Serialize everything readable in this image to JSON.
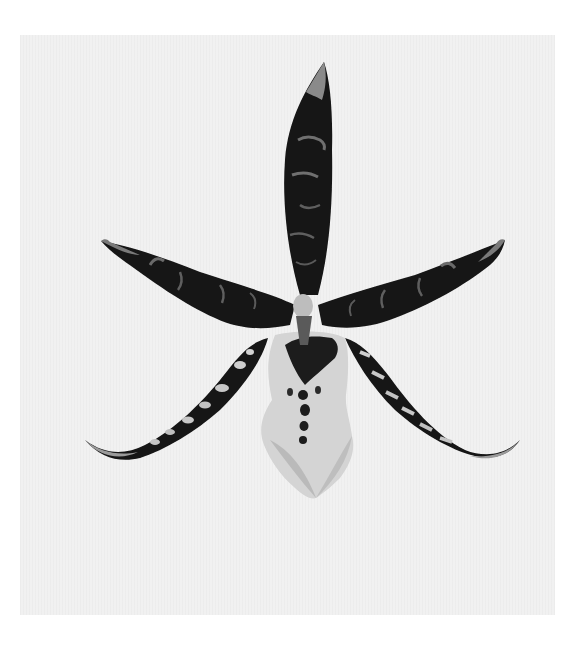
{
  "image": {
    "subject": "Botanical illustration of a spotted orchid flower",
    "width": 584,
    "height": 661,
    "colors": {
      "background": "#ffffff",
      "paper": "#f1f1f1",
      "petal_dark": "#141414",
      "petal_mottle": "#8a8a8a",
      "lip_light": "#d4d4d4",
      "lip_shadow": "#9a9a9a",
      "column": "#bdbdbd"
    },
    "elements": [
      {
        "name": "dorsal-sepal",
        "description": "Upright narrow dark sepal with pale tip"
      },
      {
        "name": "left-petal",
        "description": "Dark mottled petal extending up-left with hooked tip"
      },
      {
        "name": "right-petal",
        "description": "Dark mottled petal extending up-right with hooked tip"
      },
      {
        "name": "left-lateral-sepal",
        "description": "Spotted sepal curving down-left"
      },
      {
        "name": "right-lateral-sepal",
        "description": "Spotted sepal curving down-right"
      },
      {
        "name": "labellum",
        "description": "Pale ruffled lip with dark central blotch and spots"
      },
      {
        "name": "column",
        "description": "Pale column at flower center"
      }
    ]
  }
}
